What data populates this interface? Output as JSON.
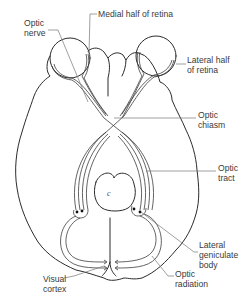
{
  "diagram": {
    "labels": {
      "optic_nerve": "Optic\nnerve",
      "medial_half_retina": "Medial half of retina",
      "lateral_half_retina": "Lateral half\nof retina",
      "optic_chiasm": "Optic\nchiasm",
      "optic_tract": "Optic\ntract",
      "lateral_geniculate_body": "Lateral\ngeniculate\nbody",
      "optic_radiation": "Optic\nradiation",
      "visual_cortex": "Visual\ncortex"
    },
    "structure_marks": {
      "midbrain_letter": "c"
    },
    "colors": {
      "line": "#2b2b2b",
      "leader": "#777777",
      "text": "#3a3a3a",
      "background": "#ffffff"
    }
  }
}
